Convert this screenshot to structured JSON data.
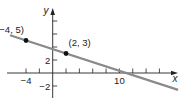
{
  "chart_data": {
    "type": "line",
    "title": "",
    "xlabel": "x",
    "ylabel": "y",
    "xlim": [
      -6.8,
      18.8
    ],
    "ylim": [
      -3.8,
      9.8
    ],
    "grid": false,
    "x_tick_step": 2,
    "y_tick_step": 2,
    "x_tick_labels": [
      {
        "value": -4,
        "label": "−4"
      },
      {
        "value": 10,
        "label": "10"
      }
    ],
    "y_tick_labels": [
      {
        "value": 2,
        "label": "2"
      },
      {
        "value": -2,
        "label": "−2"
      }
    ],
    "series": [
      {
        "name": "line through (-4, 5) and (2, 3)",
        "equation": "y = -x/3 + 11/3",
        "slope": -0.3333,
        "y_intercept": 3.6667,
        "x_intercept": 11,
        "x": [
          -6.4,
          18.8
        ],
        "y": [
          5.8,
          -2.6
        ],
        "color": "#8a8a8a"
      }
    ],
    "points": [
      {
        "x": -4,
        "y": 5,
        "label": "(−4, 5)"
      },
      {
        "x": 2,
        "y": 3,
        "label": "(2, 3)"
      }
    ]
  },
  "colors": {
    "axis": "#222222",
    "line": "#8a8a8a",
    "point": "#111111",
    "background": "#ffffff"
  }
}
